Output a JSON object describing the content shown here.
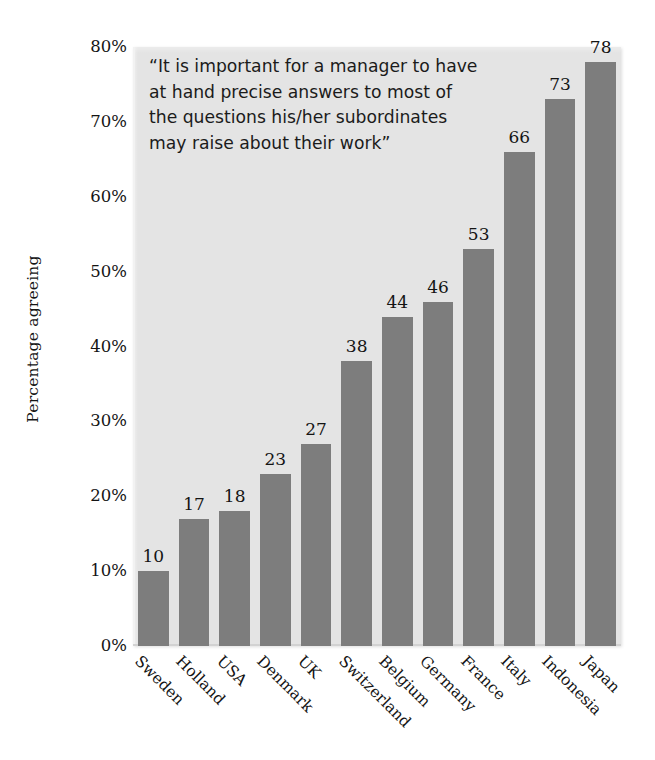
{
  "chart_data": {
    "type": "bar",
    "title": "",
    "annotation": "“It is important for a manager to have\nat hand precise answers to most of\nthe questions his/her subordinates\nmay raise about their work”",
    "xlabel": "",
    "ylabel": "Percentage agreeing",
    "categories": [
      "Sweden",
      "Holland",
      "USA",
      "Denmark",
      "UK",
      "Switzerland",
      "Belgium",
      "Germany",
      "France",
      "Italy",
      "Indonesia",
      "Japan"
    ],
    "values": [
      10,
      17,
      18,
      23,
      27,
      38,
      44,
      46,
      53,
      66,
      73,
      78
    ],
    "value_labels": [
      "10",
      "17",
      "18",
      "23",
      "27",
      "38",
      "44",
      "46",
      "53",
      "66",
      "73",
      "78"
    ],
    "ylim": [
      0,
      80
    ],
    "ytick_values": [
      0,
      10,
      20,
      30,
      40,
      50,
      60,
      70,
      80
    ],
    "ytick_labels": [
      "0%",
      "10%",
      "20%",
      "30%",
      "40%",
      "50%",
      "60%",
      "70%",
      "80%"
    ],
    "grid": false,
    "legend": "none",
    "bar_color": "#7d7d7d",
    "plot_background": "#e4e4e4",
    "page_background": "#ffffff",
    "text_color": "#141414",
    "xtick_rotation": 45
  }
}
